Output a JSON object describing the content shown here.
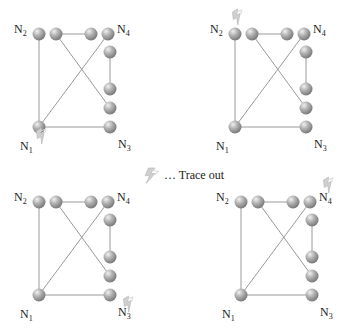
{
  "diagram": {
    "type": "network-trace-illustration",
    "legend": {
      "icon": "lightning-bolt-icon",
      "text": "… Trace out"
    },
    "colors": {
      "node": "#a8a8a8",
      "node_highlight": "#e6e6e6",
      "edge": "#9a9a9a",
      "trace_icon": "#c8c8c8",
      "label": "#222222"
    },
    "node_labels": {
      "N1": "N",
      "N2": "N",
      "N3": "N",
      "N4": "N"
    },
    "panels": [
      {
        "id": "top-left",
        "offset": [
          0,
          0
        ],
        "trace_out_at": "N1"
      },
      {
        "id": "top-right",
        "offset": [
          196,
          0
        ],
        "trace_out_at": "N2"
      },
      {
        "id": "bottom-left",
        "offset": [
          0,
          168
        ],
        "trace_out_at": "N3"
      },
      {
        "id": "bottom-right",
        "offset": [
          202,
          168
        ],
        "trace_out_at": "N4"
      }
    ],
    "nodes": [
      {
        "id": "N2",
        "x": 39,
        "y": 34,
        "label": "N",
        "sub": "2",
        "label_pos": [
          14,
          33
        ]
      },
      {
        "id": "a",
        "x": 56,
        "y": 34
      },
      {
        "id": "b",
        "x": 91,
        "y": 34
      },
      {
        "id": "N4",
        "x": 108,
        "y": 34,
        "label": "N",
        "sub": "4",
        "label_pos": [
          117,
          33
        ]
      },
      {
        "id": "c",
        "x": 110,
        "y": 52
      },
      {
        "id": "d",
        "x": 110,
        "y": 89
      },
      {
        "id": "e",
        "x": 110,
        "y": 108
      },
      {
        "id": "N3",
        "x": 110,
        "y": 127,
        "label": "N",
        "sub": "3",
        "label_pos": [
          118,
          148
        ]
      },
      {
        "id": "N1",
        "x": 39,
        "y": 127,
        "label": "N",
        "sub": "1",
        "label_pos": [
          20,
          150
        ]
      }
    ],
    "edges": [
      [
        "N2",
        "N1"
      ],
      [
        "a",
        "b"
      ],
      [
        "a",
        "e"
      ],
      [
        "N4",
        "N1"
      ],
      [
        "c",
        "d"
      ],
      [
        "N1",
        "N3"
      ]
    ]
  }
}
